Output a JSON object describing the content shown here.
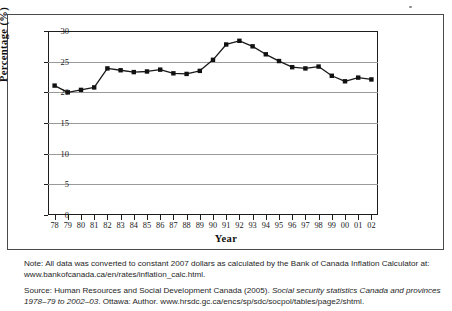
{
  "figure": {
    "y_axis_title": "Percentage (%)",
    "x_axis_title": "Year",
    "note_line1": "Note: All data was converted to constant 2007 dollars as calculated by the Bank of Canada Inflation Calculator",
    "note_line2": "at: www.bankofcanada.ca/en/rates/inflation_calc.html.",
    "source_prefix": "Source: Human Resources and Social Development Canada (2005). ",
    "source_italic1": "Social security statistics Canada and",
    "source_italic2": "provinces 1978–79 to 2002–03",
    "source_suffix": ". Ottawa: Author. www.hrsdc.gc.ca/encs/sp/sdc/socpol/tables/page2/shtml."
  },
  "chart_data": {
    "type": "line",
    "title": "",
    "xlabel": "Year",
    "ylabel": "Percentage (%)",
    "ylim": [
      0,
      30
    ],
    "yticks": [
      0,
      5,
      10,
      15,
      20,
      25,
      30
    ],
    "grid": true,
    "legend": "none",
    "marker": "square",
    "line_color": "#1a1a1a",
    "marker_color": "#111111",
    "categories": [
      "78",
      "79",
      "80",
      "81",
      "82",
      "83",
      "84",
      "85",
      "86",
      "87",
      "88",
      "89",
      "90",
      "91",
      "92",
      "93",
      "94",
      "95",
      "96",
      "97",
      "98",
      "99",
      "00",
      "01",
      "02"
    ],
    "values": [
      21.1,
      20.0,
      20.4,
      20.8,
      23.9,
      23.6,
      23.3,
      23.4,
      23.7,
      23.1,
      23.0,
      23.5,
      25.3,
      27.8,
      28.4,
      27.5,
      26.2,
      25.1,
      24.1,
      23.9,
      24.2,
      22.7,
      21.8,
      22.4,
      22.1
    ]
  }
}
